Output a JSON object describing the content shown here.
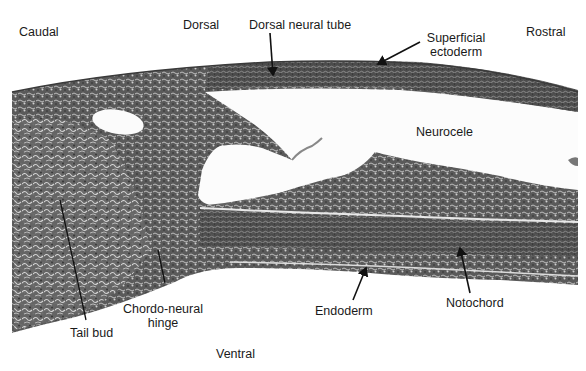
{
  "figure": {
    "type": "histology-micrograph",
    "orientation_labels": {
      "caudal": "Caudal",
      "dorsal": "Dorsal",
      "rostral": "Rostral",
      "ventral": "Ventral"
    },
    "structure_labels": {
      "dorsal_neural_tube": "Dorsal neural tube",
      "superficial_ectoderm_line1": "Superficial",
      "superficial_ectoderm_line2": "ectoderm",
      "neurocele": "Neurocele",
      "tail_bud": "Tail bud",
      "chordo_neural_line1": "Chordo-neural",
      "chordo_neural_line2": "hinge",
      "endoderm": "Endoderm",
      "notochord": "Notochord"
    },
    "colors": {
      "background": "#ffffff",
      "tissue_dark": "#4a4a4a",
      "tissue_mid": "#6e6e6e",
      "tissue_light": "#b5b5b5",
      "lumen": "#fafafa",
      "text": "#1a1a1a",
      "leader_line": "#111111"
    }
  }
}
